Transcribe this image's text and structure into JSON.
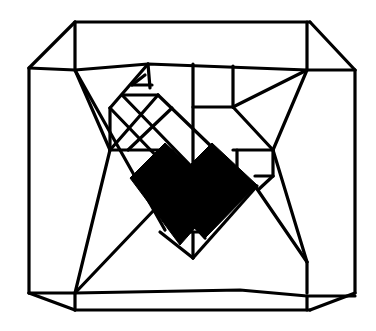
{
  "diagram": {
    "title": "Octagonal wireframe with central black diamond",
    "type": "line-drawing",
    "stroke_color": "#000000",
    "background_color": "#ffffff",
    "fill_color": "#000000",
    "outer_frame": {
      "description": "Chamfered rectangle (octagon) outline",
      "vertices": [
        [
          75,
          22
        ],
        [
          310,
          22
        ],
        [
          355,
          68
        ],
        [
          355,
          293
        ],
        [
          310,
          310
        ],
        [
          75,
          310
        ],
        [
          29,
          290
        ],
        [
          29,
          68
        ]
      ]
    },
    "inner_frame": {
      "description": "Inner quadrilateral connected to outer corners",
      "vertices": [
        [
          75,
          70
        ],
        [
          148,
          64
        ],
        [
          307,
          70
        ],
        [
          307,
          262
        ],
        [
          240,
          266
        ],
        [
          75,
          262
        ]
      ]
    },
    "central_shape": {
      "description": "Black filled diamond/heart region",
      "vertices": [
        [
          130,
          180
        ],
        [
          165,
          146
        ],
        [
          178,
          160
        ],
        [
          185,
          170
        ],
        [
          200,
          160
        ],
        [
          215,
          146
        ],
        [
          255,
          186
        ],
        [
          205,
          240
        ],
        [
          182,
          210
        ],
        [
          205,
          240
        ],
        [
          130,
          180
        ]
      ]
    }
  }
}
